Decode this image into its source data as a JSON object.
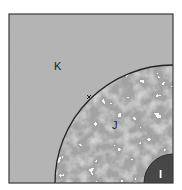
{
  "diagram": {
    "type": "concentric-quarter-regions",
    "regions": [
      {
        "id": "outer",
        "label": "K",
        "fill": "#b3b3b3",
        "texture": "smooth"
      },
      {
        "id": "middle",
        "label": "J",
        "fill": "#a6a6a6",
        "texture": "mottled"
      },
      {
        "id": "inner",
        "label": "I",
        "fill": "#474747",
        "texture": "solid"
      }
    ],
    "boundary_marker": "x",
    "colors": {
      "frame": "#3a3a3a",
      "arc": "#222222",
      "label_dark": "#222222",
      "label_light": "#ffffff"
    }
  }
}
